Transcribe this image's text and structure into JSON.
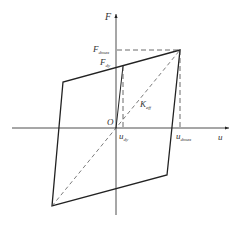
{
  "diagram": {
    "type": "bilinear hysteresis loop",
    "colors": {
      "line": "#222222",
      "dashed": "#444444",
      "text": "#333333",
      "background": "#ffffff"
    },
    "axes": {
      "y_label": "F",
      "x_label": "u",
      "origin_label": "O"
    },
    "labels": {
      "F_dmax": {
        "main": "F",
        "sub": "dmax"
      },
      "F_dy": {
        "main": "F",
        "sub": "dy"
      },
      "u_dy": {
        "main": "u",
        "sub": "dy"
      },
      "u_dmax": {
        "main": "u",
        "sub": "dmax"
      },
      "K_eff": {
        "main": "K",
        "sub": "eff"
      }
    },
    "loop_vertices": [
      {
        "name": "peak",
        "x": 180,
        "y": 50
      },
      {
        "name": "upper-left",
        "x": 63,
        "y": 82
      },
      {
        "name": "lower-left",
        "x": 52,
        "y": 206
      },
      {
        "name": "lower-right",
        "x": 167,
        "y": 175
      }
    ]
  }
}
